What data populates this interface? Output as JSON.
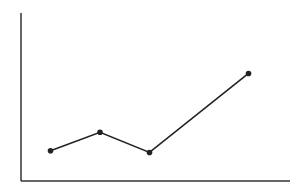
{
  "chart_data": {
    "type": "line",
    "title": "",
    "xlabel": "",
    "ylabel": "",
    "x": [
      1,
      2,
      3,
      5
    ],
    "series": [
      {
        "name": "",
        "values": [
          18,
          29,
          17,
          64
        ]
      }
    ],
    "xlim": [
      0,
      5.5
    ],
    "ylim": [
      0,
      100
    ],
    "grid": false,
    "legend": false,
    "ticks": false,
    "markers": true
  },
  "style": {
    "line_color": "#222222",
    "axis_color": "#333333",
    "background": "#ffffff"
  },
  "layout": {
    "axis_left": 21,
    "axis_bottom": 181,
    "axis_top": 13,
    "axis_right": 290,
    "x_origin_px": 1,
    "x_unit_px": 49.5
  }
}
